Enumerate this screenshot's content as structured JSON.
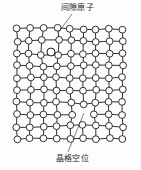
{
  "figure": {
    "title_top_label": "间隙原子",
    "title_bottom_label": "晶格空位",
    "background_color": "#fdfdfd",
    "line_color": "#1b1b1b",
    "atom_fill_color": "#ffffff",
    "atom_stroke_color": "#1b1b1b"
  },
  "diagram_data": {
    "type": "lattice-defect-schematic",
    "grid": {
      "columns": 9,
      "rows": 10,
      "origin_x": 17,
      "origin_y": 29,
      "spacing_x": 13.2,
      "spacing_y": 12.2,
      "atom_radius": 3.4
    },
    "defects": [
      {
        "kind": "interstitial-atom",
        "label": "间隙原子",
        "grid_position": "between columns 3-4, rows 1-2",
        "pixel_position": {
          "x": 51,
          "y": 52
        },
        "leader_line": {
          "x1": 72,
          "y1": 14,
          "x2": 58,
          "y2": 33
        }
      },
      {
        "kind": "lattice-vacancy",
        "label": "晶格空位",
        "grid_position": "column 6, row 8",
        "pixel_position": {
          "x": 83,
          "y": 114
        },
        "leader_line": {
          "x1": 68,
          "y1": 152,
          "x2": 84,
          "y2": 113
        }
      }
    ],
    "distorted_regions": [
      "rows 1-3 near interstitial are bowed outward",
      "rows 7-9 near vacancy are pulled inward"
    ]
  }
}
